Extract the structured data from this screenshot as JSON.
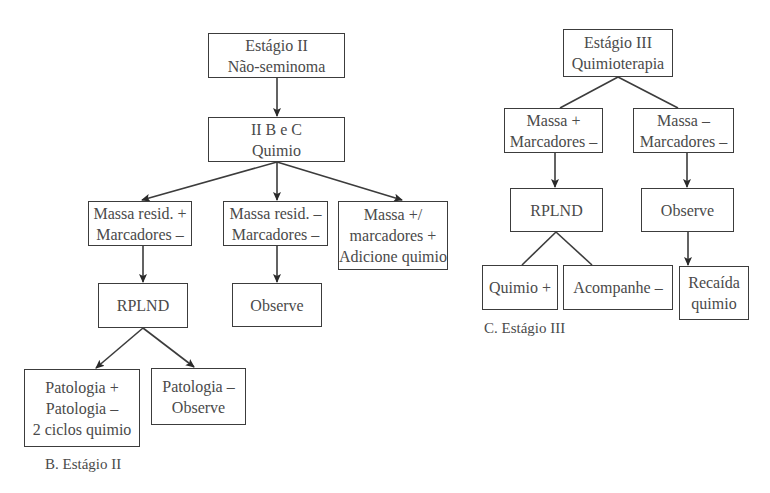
{
  "panel_b": {
    "caption": "B. Estágio II",
    "nodes": {
      "root": [
        "Estágio II",
        "Não-seminoma"
      ],
      "chemo": [
        "II B e C",
        "Quimio"
      ],
      "resid_pos": [
        "Massa resid. +",
        "Marcadores –"
      ],
      "resid_neg": [
        "Massa resid. –",
        "Marcadores –"
      ],
      "markers_pos": [
        "Massa +/",
        "marcadores +",
        "Adicione quimio"
      ],
      "rplnd": [
        "RPLND"
      ],
      "observe": [
        "Observe"
      ],
      "path_pos": [
        "Patologia +",
        "Patologia –",
        "2 ciclos quimio"
      ],
      "path_neg": [
        "Patologia –",
        "Observe"
      ]
    }
  },
  "panel_c": {
    "caption": "C. Estágio III",
    "nodes": {
      "root": [
        "Estágio III",
        "Quimioterapia"
      ],
      "mass_pos": [
        "Massa +",
        "Marcadores –"
      ],
      "mass_neg": [
        "Massa –",
        "Marcadores –"
      ],
      "rplnd": [
        "RPLND"
      ],
      "observe": [
        "Observe"
      ],
      "chemo_pos": [
        "Quimio +"
      ],
      "follow_neg": [
        "Acompanhe –"
      ],
      "relapse": [
        "Recaída",
        "quimio"
      ]
    }
  },
  "colors": {
    "line": "#3c3c3c",
    "text": "#4a4a4a",
    "background": "#ffffff"
  }
}
